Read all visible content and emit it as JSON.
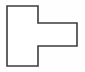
{
  "canvas": {
    "width": 85,
    "height": 72,
    "background_color": "#fefefe"
  },
  "figure": {
    "name": "rotated-t-shape",
    "kind": "polygon-outline",
    "label": "",
    "fill_color": "#ffffff",
    "stroke_color": "#3c3c3c",
    "stroke_width": 1.6,
    "vertex_count": 8,
    "points": "7,6 38,6 38,23 77,23 77,46 38,46 38,66 7,66",
    "vertices": [
      {
        "x": 7,
        "y": 6
      },
      {
        "x": 38,
        "y": 6
      },
      {
        "x": 38,
        "y": 23
      },
      {
        "x": 77,
        "y": 23
      },
      {
        "x": 77,
        "y": 46
      },
      {
        "x": 38,
        "y": 46
      },
      {
        "x": 38,
        "y": 66
      },
      {
        "x": 7,
        "y": 66
      }
    ]
  }
}
